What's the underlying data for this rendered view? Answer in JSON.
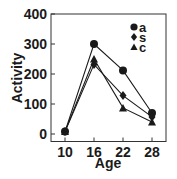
{
  "chart_data": {
    "type": "line",
    "title": "",
    "xlabel": "Age",
    "ylabel": "Activity",
    "x": [
      10,
      16,
      22,
      28
    ],
    "xticks": [
      "10",
      "16",
      "22",
      "28"
    ],
    "yticks": [
      "0",
      "100",
      "200",
      "300",
      "400"
    ],
    "ylim": [
      0,
      400
    ],
    "grid": false,
    "legend_position": "upper right",
    "series": [
      {
        "name": "a",
        "marker": "circle",
        "values": [
          8,
          300,
          212,
          70
        ]
      },
      {
        "name": "s",
        "marker": "diamond",
        "values": [
          8,
          232,
          128,
          57
        ]
      },
      {
        "name": "c",
        "marker": "triangle",
        "values": [
          8,
          250,
          87,
          40
        ]
      }
    ]
  },
  "colors": {
    "ink": "#1a1a1a",
    "background": "#ffffff"
  }
}
